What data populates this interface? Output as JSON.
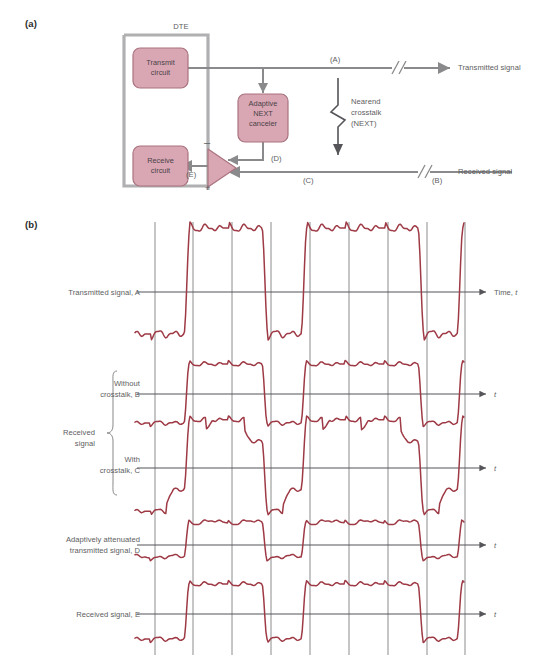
{
  "figure": {
    "panel_a_tag": "(a)",
    "panel_b_tag": "(b)",
    "colors": {
      "waveform": "#9e3a45",
      "box_fill": "#d9a7b4",
      "box_stroke": "#a9737f",
      "wire": "#8a8a8c",
      "dte_bracket": "#a9a9ab",
      "text": "#5d5d60",
      "gridline": "#6f6f72",
      "axis": "#55555a"
    }
  },
  "panel_a": {
    "dte_label": "DTE",
    "blocks": [
      {
        "id": "transmit",
        "line1": "Transmit",
        "line2": "circuit"
      },
      {
        "id": "receive",
        "line1": "Receive",
        "line2": "circuit"
      },
      {
        "id": "canceler",
        "line1": "Adaptive",
        "line2": "NEXT",
        "line3": "canceler"
      }
    ],
    "signal_labels": {
      "a": "(A)",
      "b": "(B)",
      "c": "(C)",
      "d": "(D)",
      "e": "(E)"
    },
    "summer": {
      "minus": "–",
      "plus": "+"
    },
    "crosstalk": {
      "line1": "Nearend",
      "line2": "crosstalk",
      "line3": "(NEXT)"
    },
    "outputs": {
      "transmitted": "Transmitted signal",
      "received": "Received signal"
    }
  },
  "panel_b": {
    "axis_label_first": "Time, ",
    "axis_label_first_italic": "t",
    "axis_label_italic": "t",
    "group_brace_label_line1": "Received",
    "group_brace_label_line2": "signal",
    "traces": [
      {
        "id": "A",
        "label_line1": "Transmitted signal, A",
        "label_line2": ""
      },
      {
        "id": "B",
        "label_line1": "Without",
        "label_line2": "crosstalk, B"
      },
      {
        "id": "C",
        "label_line1": "With",
        "label_line2": "crosstalk, C"
      },
      {
        "id": "D",
        "label_line1": "Adaptively attenuated",
        "label_line2": "transmitted signal, D"
      },
      {
        "id": "E",
        "label_line1": "Received signal, E",
        "label_line2": ""
      }
    ]
  },
  "chart_data": {
    "type": "line",
    "xlabel": "Time, t",
    "ylabel": "",
    "grid": true,
    "legend_position": "left-of-axes",
    "x_gridlines": [
      155,
      193,
      232,
      271,
      310,
      349,
      388,
      427,
      465
    ],
    "x_range": [
      145,
      465
    ],
    "bit_period_px": 39,
    "note": "Each trace is a bandlimited NRZ pulse train with Gibbs ringing on flat levels; symbol pattern is the same bit sequence across traces.",
    "bit_sequence": [
      0,
      1,
      1,
      0,
      1,
      1,
      1,
      0,
      1,
      0
    ],
    "series": [
      {
        "name": "Transmitted signal, A",
        "id": "A",
        "baseline_y": 292,
        "high_y": 228,
        "low_y": 334,
        "amplitude_px": 64,
        "description": "Full amplitude transmitted NRZ signal, large swing about the axis"
      },
      {
        "name": "Without crosstalk, B",
        "id": "B",
        "baseline_y": 394,
        "high_y": 364,
        "low_y": 423,
        "amplitude_px": 30,
        "description": "Attenuated received signal, clean symmetric eye, no interference"
      },
      {
        "name": "With crosstalk, C",
        "id": "C",
        "baseline_y": 468,
        "high_y": 432,
        "low_y": 502,
        "amplitude_px": 36,
        "description": "Received signal corrupted by near-end crosstalk; irregular steps and partial levels"
      },
      {
        "name": "Adaptively attenuated transmitted signal, D",
        "id": "D",
        "baseline_y": 545,
        "high_y": 522,
        "low_y": 557,
        "amplitude_px": 23,
        "description": "Scaled replica of A produced by the adaptive NEXT canceler, offset asymmetrically"
      },
      {
        "name": "Received signal, E",
        "id": "E",
        "baseline_y": 614,
        "high_y": 584,
        "low_y": 639,
        "amplitude_px": 30,
        "description": "Output of the summing junction, crosstalk removed, matches B"
      }
    ]
  }
}
